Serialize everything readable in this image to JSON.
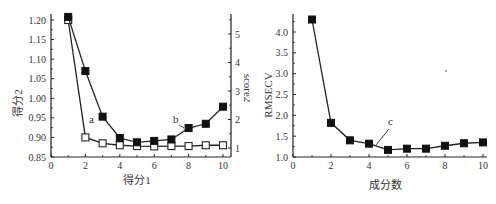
{
  "chart_data": [
    {
      "type": "line",
      "title": "",
      "xlabel": "得分1",
      "ylabel": "得分2",
      "y2label": "score2",
      "x": [
        1,
        2,
        3,
        4,
        5,
        6,
        7,
        8,
        9,
        10
      ],
      "xlim": [
        0,
        10.5
      ],
      "xticks": [
        "0",
        "2",
        "4",
        "6",
        "8",
        "10"
      ],
      "ylim": [
        0.85,
        1.22
      ],
      "yticks": [
        "0.85",
        "0.90",
        "0.95",
        "1.00",
        "1.05",
        "1.10",
        "1.15",
        "1.20"
      ],
      "y2lim": [
        0.7,
        5.7
      ],
      "y2ticks": [
        "1",
        "2",
        "3",
        "4",
        "5"
      ],
      "grid": false,
      "series": [
        {
          "name": "a",
          "axis": "left",
          "marker": "open-square",
          "values": [
            1.2,
            0.9,
            0.885,
            0.88,
            0.878,
            0.877,
            0.878,
            0.878,
            0.88,
            0.88
          ]
        },
        {
          "name": "b",
          "axis": "right",
          "marker": "filled-square",
          "values": [
            5.6,
            3.7,
            2.1,
            1.35,
            1.2,
            1.25,
            1.3,
            1.7,
            1.85,
            2.45
          ]
        }
      ],
      "annotations": [
        "a",
        "b"
      ]
    },
    {
      "type": "line",
      "title": "",
      "xlabel": "成分数",
      "ylabel": "RMSECV",
      "x": [
        1,
        2,
        3,
        4,
        5,
        6,
        7,
        8,
        9,
        10
      ],
      "xlim": [
        0,
        10
      ],
      "xticks": [
        "0",
        "2",
        "4",
        "6",
        "8",
        "10"
      ],
      "ylim": [
        1.0,
        4.4
      ],
      "yticks": [
        "1.0",
        "1.5",
        "2.0",
        "2.5",
        "3.0",
        "3.5",
        "4.0"
      ],
      "grid": false,
      "series": [
        {
          "name": "c",
          "marker": "filled-square",
          "values": [
            4.3,
            1.82,
            1.4,
            1.32,
            1.17,
            1.2,
            1.2,
            1.27,
            1.33,
            1.35
          ]
        }
      ],
      "annotations": [
        "c"
      ]
    }
  ]
}
